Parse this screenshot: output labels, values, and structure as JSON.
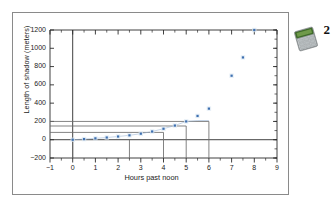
{
  "figure": {
    "badge": {
      "icon": "graphing-calculator-icon",
      "number": "2"
    }
  },
  "chart_data": {
    "type": "scatter",
    "title": "",
    "xlabel": "Hours past noon",
    "ylabel": "Length of shadow (meters)",
    "xlim": [
      -1,
      9
    ],
    "ylim": [
      -200,
      1200
    ],
    "xticks": [
      -1,
      0,
      1,
      2,
      3,
      4,
      5,
      6,
      7,
      8,
      9
    ],
    "xtick_labels": [
      "−1",
      "0",
      "1",
      "2",
      "3",
      "4",
      "5",
      "6",
      "7",
      "8",
      "9"
    ],
    "yticks": [
      -200,
      0,
      200,
      400,
      600,
      800,
      1000,
      1200
    ],
    "ytick_labels": [
      "−200",
      "0",
      "200",
      "400",
      "600",
      "800",
      "1000",
      "1200"
    ],
    "minor_xticks": true,
    "grid": false,
    "legend": null,
    "marker_color": "#3d6fb0",
    "series": [
      {
        "name": "shadow length",
        "x": [
          0,
          0.5,
          1,
          1.5,
          2,
          2.5,
          3,
          3.5,
          4,
          4.5,
          5,
          5.5,
          6,
          7,
          7.5,
          8
        ],
        "y": [
          0,
          7,
          15,
          24,
          35,
          48,
          66,
          90,
          120,
          155,
          200,
          260,
          340,
          700,
          900,
          1460
        ]
      }
    ],
    "annotations": {
      "horizontal_reference_lines": [
        200,
        150,
        80,
        0
      ],
      "vertical_drop_lines": [
        0,
        2.5,
        4,
        5,
        6
      ]
    }
  }
}
